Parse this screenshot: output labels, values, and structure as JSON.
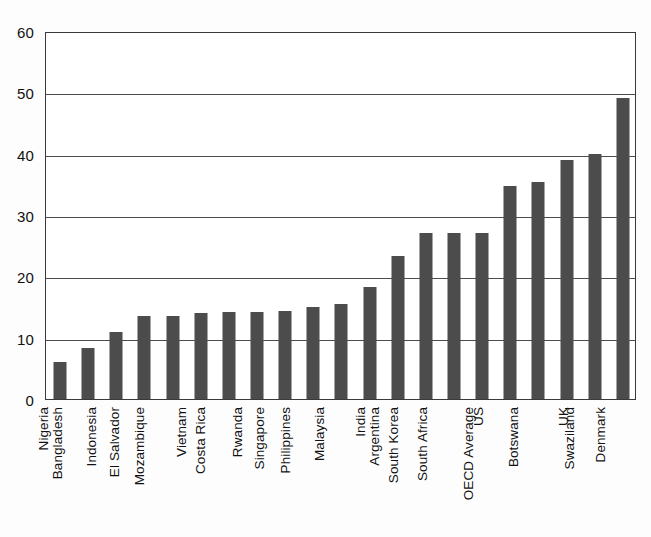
{
  "chart_data": {
    "type": "bar",
    "title": "",
    "subtitle": "",
    "xlabel": "",
    "ylabel": "",
    "ylim": [
      0,
      60
    ],
    "yticks": [
      0,
      10,
      20,
      30,
      40,
      50,
      60
    ],
    "ytick_labels": [
      "0",
      "10",
      "20",
      "30",
      "40",
      "50",
      "60"
    ],
    "grid": true,
    "grid_axis": "y",
    "legend": false,
    "legend_position": "none",
    "bar_color": "#4c4c4c",
    "background_color": "#ffffff",
    "axis_color": "#3a3a3a",
    "categories": [
      "Nigeria",
      "Bangladesh",
      "Indonesia",
      "El Salvador",
      "Mozambique",
      "Vietnam",
      "Costa Rica",
      "Rwanda",
      "Singapore",
      "Philippines",
      "Malaysia",
      "India",
      "Argentina",
      "South Korea",
      "South Africa",
      "US",
      "OECD Average",
      "Botswana",
      "UK",
      "Swaziland",
      "Denmark"
    ],
    "values": [
      6,
      8.3,
      11,
      13.5,
      13.6,
      14.1,
      14.2,
      14.2,
      14.3,
      15,
      15.5,
      18.3,
      23.3,
      27,
      27,
      27,
      34.8,
      35.4,
      39,
      40,
      49
    ]
  }
}
